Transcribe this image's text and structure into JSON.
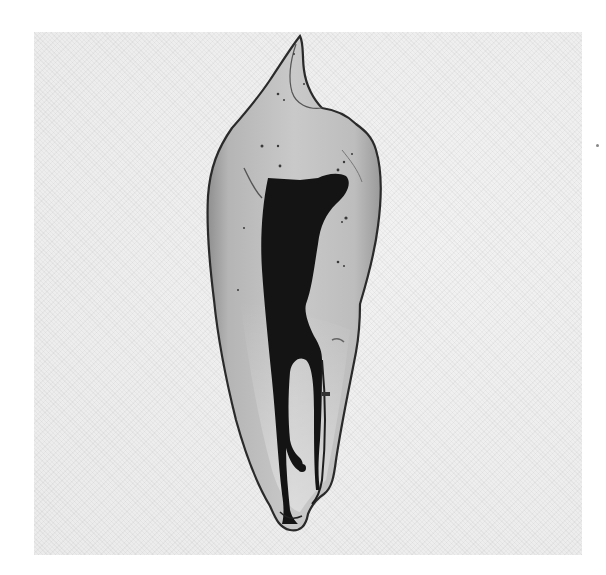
{
  "image": {
    "subject": "Cleared tooth specimen with dye-filled root canal system",
    "description": "Grayscale photograph of a single-rooted tooth; translucent dentin with dark stained pulp chamber and canal showing apical branching",
    "colors": {
      "background": "#ffffff",
      "panel": "#eeeeee",
      "dentin_light": "#c8c8c8",
      "dentin_mid": "#a9a9a9",
      "outline": "#2a2a2a",
      "canal": "#141414"
    }
  }
}
